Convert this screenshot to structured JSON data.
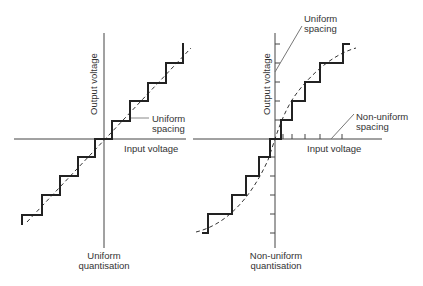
{
  "left_diagram": {
    "title_line1": "Uniform",
    "title_line2": "quantisation",
    "y_axis_label": "Output voltage",
    "x_axis_label": "Input voltage",
    "annotation_line1": "Uniform",
    "annotation_line2": "spacing"
  },
  "right_diagram": {
    "title_line1": "Non-uniform",
    "title_line2": "quantisation",
    "y_axis_label": "Output voltage",
    "x_axis_label": "Input voltage",
    "annotation_top_line1": "Uniform",
    "annotation_top_line2": "spacing",
    "annotation_right_line1": "Non-uniform",
    "annotation_right_line2": "spacing"
  },
  "colors": {
    "staircase": "#222222",
    "axis": "#444444",
    "dashed": "#333333"
  }
}
